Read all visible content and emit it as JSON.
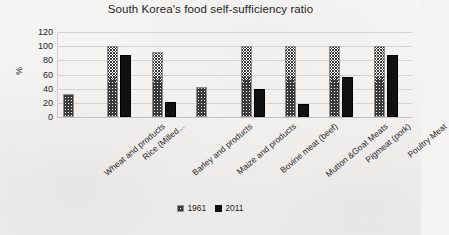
{
  "chart_data": {
    "type": "bar",
    "title": "South Korea's food self-sufficiency ratio",
    "xlabel": "",
    "ylabel": "%",
    "ylim": [
      0,
      120
    ],
    "ytick_step": 20,
    "yticks": [
      120,
      100,
      80,
      60,
      40,
      20,
      0
    ],
    "grid": true,
    "legend_position": "bottom",
    "categories": [
      "Wheat and products",
      "Rice (Milled...",
      "Barley and products",
      "Maize and products",
      "Bovine meat (beef)",
      "Mutton &Goat Meats",
      "Pigmeat (pork)",
      "Poultry Meat"
    ],
    "series": [
      {
        "name": "1961",
        "pattern": "diagonal-crosshatch",
        "color": "#3a3a3a",
        "values": [
          32,
          100,
          92,
          43,
          100,
          100,
          100,
          100
        ]
      },
      {
        "name": "2011",
        "pattern": "solid",
        "color": "#111111",
        "values": [
          0,
          88,
          21,
          0,
          40,
          18,
          57,
          87
        ]
      }
    ]
  },
  "legend": {
    "items": [
      {
        "label": "1961"
      },
      {
        "label": "2011"
      }
    ]
  }
}
